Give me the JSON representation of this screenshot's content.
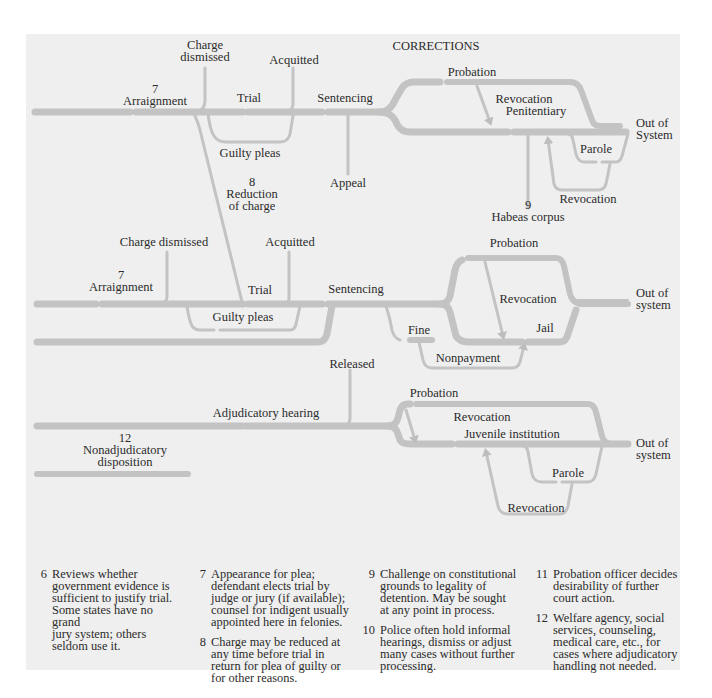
{
  "diagram": {
    "title": "CORRECTIONS",
    "colors": {
      "panel_bg": "#efefef",
      "flow_line": "#c3c3c3",
      "text": "#2b2b2b"
    },
    "felony": {
      "charge_dismissed": "Charge\ndismissed",
      "acquitted": "Acquitted",
      "arraignment_num": "7",
      "arraignment": "Arraignment",
      "trial": "Trial",
      "sentencing": "Sentencing",
      "guilty_pleas": "Guilty pleas",
      "reduction_num": "8",
      "reduction": "Reduction\nof charge",
      "appeal": "Appeal",
      "probation": "Probation",
      "revocation_1": "Revocation",
      "penitentiary": "Penitentiary",
      "out_of_system": "Out of\nSystem",
      "parole": "Parole",
      "revocation_2": "Revocation",
      "habeas_num": "9",
      "habeas": "Habeas corpus"
    },
    "misdemeanor": {
      "charge_dismissed": "Charge dismissed",
      "acquitted": "Acquitted",
      "arraignment_num": "7",
      "arraignment": "Arraignment",
      "trial": "Trial",
      "sentencing": "Sentencing",
      "guilty_pleas": "Guilty pleas",
      "probation": "Probation",
      "revocation": "Revocation",
      "out_of_system": "Out of\nsystem",
      "fine": "Fine",
      "jail": "Jail",
      "nonpayment": "Nonpayment"
    },
    "juvenile": {
      "released": "Released",
      "adjudicatory_hearing": "Adjudicatory hearing",
      "nonadjudicatory_num": "12",
      "nonadjudicatory": "Nonadjudicatory\ndisposition",
      "probation": "Probation",
      "revocation_1": "Revocation",
      "juvenile_institution": "Juvenile institution",
      "out_of_system": "Out of\nsystem",
      "parole": "Parole",
      "revocation_2": "Revocation"
    }
  },
  "notes": [
    {
      "num": "6",
      "text": "Reviews whether\ngovernment evidence is\nsufficient to justify trial.\nSome states have no grand\njury system; others\nseldom use it."
    },
    {
      "num": "7",
      "text": "Appearance for plea;\ndefendant elects trial by\njudge or jury (if available);\ncounsel for indigent usually\nappointed here in felonies."
    },
    {
      "num": "8",
      "text": "Charge may be reduced at\nany time before trial in\nreturn for plea of guilty or\nfor other reasons."
    },
    {
      "num": "9",
      "text": "Challenge on constitutional\ngrounds to legality of\ndetention. May be sought\nat any point in process."
    },
    {
      "num": "10",
      "text": "Police often hold informal\nhearings, dismiss or adjust\nmany cases without further\nprocessing."
    },
    {
      "num": "11",
      "text": "Probation officer decides\ndesirability of further\ncourt action."
    },
    {
      "num": "12",
      "text": "Welfare agency, social\nservices, counseling,\nmedical care, etc., for\ncases where adjudicatory\nhandling not needed."
    }
  ]
}
